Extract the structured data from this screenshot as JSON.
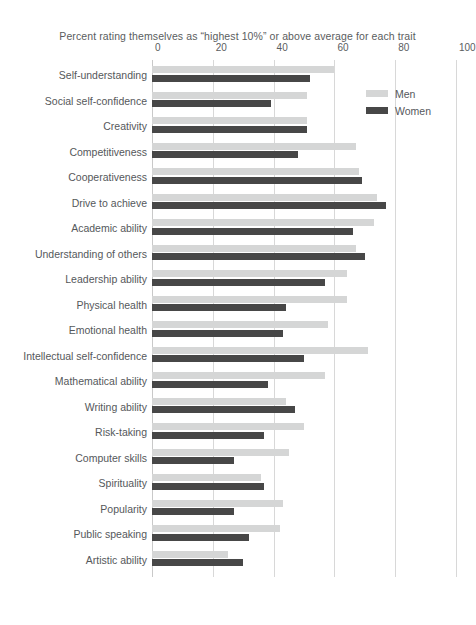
{
  "chart_data": {
    "type": "bar",
    "orientation": "horizontal",
    "title": "Percent rating themselves as “highest 10%” or above average for each trait",
    "xlabel": "",
    "ylabel": "",
    "xlim": [
      0,
      100
    ],
    "xticks": [
      0,
      20,
      40,
      60,
      80,
      100
    ],
    "xtick_labels": [
      "0",
      "20",
      "40",
      "60",
      "80",
      "100"
    ],
    "grid": true,
    "legend_position": "top-right",
    "categories": [
      "Self-understanding",
      "Social self-confidence",
      "Creativity",
      "Competitiveness",
      "Cooperativeness",
      "Drive to achieve",
      "Academic ability",
      "Understanding of others",
      "Leadership ability",
      "Physical health",
      "Emotional health",
      "Intellectual self-confidence",
      "Mathematical ability",
      "Writing ability",
      "Risk-taking",
      "Computer skills",
      "Spirituality",
      "Popularity",
      "Public speaking",
      "Artistic ability"
    ],
    "series": [
      {
        "name": "Men",
        "color": "#d5d6d6",
        "values": [
          60,
          51,
          51,
          67,
          68,
          74,
          73,
          67,
          64,
          64,
          58,
          71,
          57,
          44,
          50,
          45,
          36,
          43,
          42,
          25
        ]
      },
      {
        "name": "Women",
        "color": "#474747",
        "values": [
          52,
          39,
          51,
          48,
          69,
          77,
          66,
          70,
          57,
          44,
          43,
          50,
          38,
          47,
          37,
          27,
          37,
          27,
          32,
          30
        ]
      }
    ]
  },
  "legend": {
    "items": [
      {
        "label": "Men",
        "color": "#d5d6d6"
      },
      {
        "label": "Women",
        "color": "#474747"
      }
    ]
  },
  "colors": {
    "men": "#d5d6d6",
    "women": "#474747",
    "grid": "#d8d8d8",
    "text": "#55585b",
    "background": "#ffffff"
  }
}
